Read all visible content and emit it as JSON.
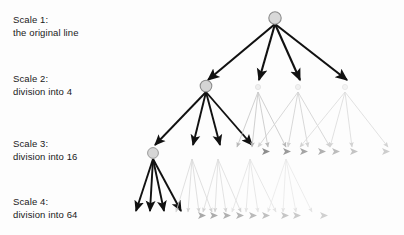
{
  "figure": {
    "background_color": "#fdfdfd",
    "width": 404,
    "height": 235
  },
  "labels": [
    {
      "id": "scale-1",
      "title": "Scale 1:",
      "subtitle": "the original line"
    },
    {
      "id": "scale-2",
      "title": "Scale 2:",
      "subtitle": "division into 4"
    },
    {
      "id": "scale-3",
      "title": "Scale 3:",
      "subtitle": "division into 16"
    },
    {
      "id": "scale-4",
      "title": "Scale 4:",
      "subtitle": "division into 64"
    }
  ],
  "diagram": {
    "type": "tree",
    "branching_factor": 4,
    "levels": 4,
    "node_counts": [
      1,
      4,
      16,
      64
    ],
    "emphasis": "leftmost-branch",
    "colors": {
      "active_edge": "#111111",
      "node_fill": "#d8d8d8",
      "node_stroke": "#8c8c8c",
      "faded_1": "#9a9a9a",
      "faded_2": "#c2c2c2",
      "faded_3": "#dcdcdc",
      "faded_4": "#ececec",
      "text": "#1a1a1a"
    },
    "level_y": [
      18,
      88,
      152,
      218
    ],
    "root_x": 275,
    "active_nodes_x": [
      275,
      206,
      153,
      140
    ]
  }
}
